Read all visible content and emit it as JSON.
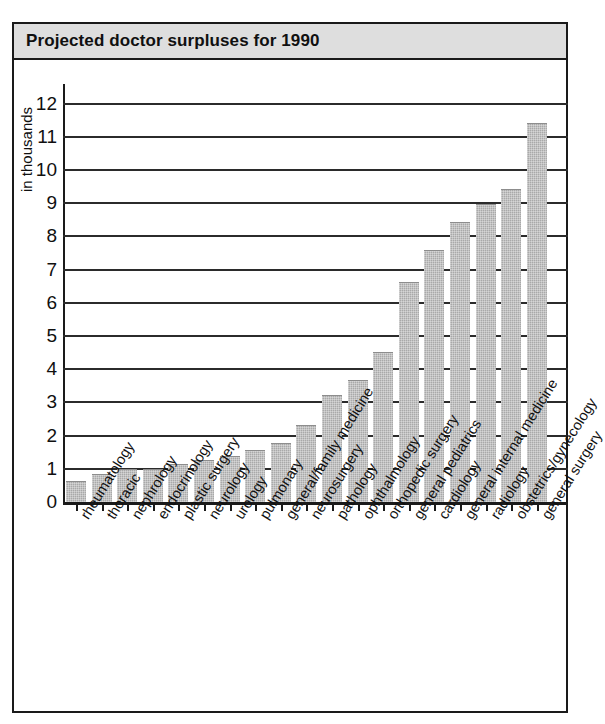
{
  "title": "Projected doctor surpluses for 1990",
  "axis": {
    "y_title": "in thousands",
    "y_ticks": [
      "0",
      "1",
      "2",
      "3",
      "4",
      "5",
      "6",
      "7",
      "8",
      "9",
      "10",
      "11",
      "12"
    ]
  },
  "colors": {
    "bar_fill": "#a9a9a9",
    "frame": "#1a1a1a",
    "title_bar": "#dedede",
    "background": "#ffffff"
  },
  "chart_data": {
    "type": "bar",
    "title": "Projected doctor surpluses for 1990",
    "xlabel": "",
    "ylabel": "in thousands",
    "ylim": [
      0,
      12
    ],
    "yticks": [
      0,
      1,
      2,
      3,
      4,
      5,
      6,
      7,
      8,
      9,
      10,
      11,
      12
    ],
    "grid": true,
    "legend": "none",
    "categories": [
      "rheumatology",
      "thoracic",
      "nephrology",
      "endocrinology",
      "plastic surgery",
      "neurology",
      "urology",
      "pulmonary",
      "general/family medicine",
      "neurosurgery",
      "pathology",
      "ophthalmology",
      "orthopedic surgery",
      "general pediatrics",
      "cardiology",
      "general internal medicine",
      "radiology",
      "obstetrics/gynecology",
      "general surgery"
    ],
    "values": [
      0.6,
      0.8,
      0.95,
      0.95,
      1.1,
      1.25,
      1.35,
      1.55,
      1.75,
      2.3,
      3.2,
      3.65,
      4.5,
      6.6,
      7.55,
      8.4,
      8.95,
      9.4,
      11.4
    ]
  }
}
